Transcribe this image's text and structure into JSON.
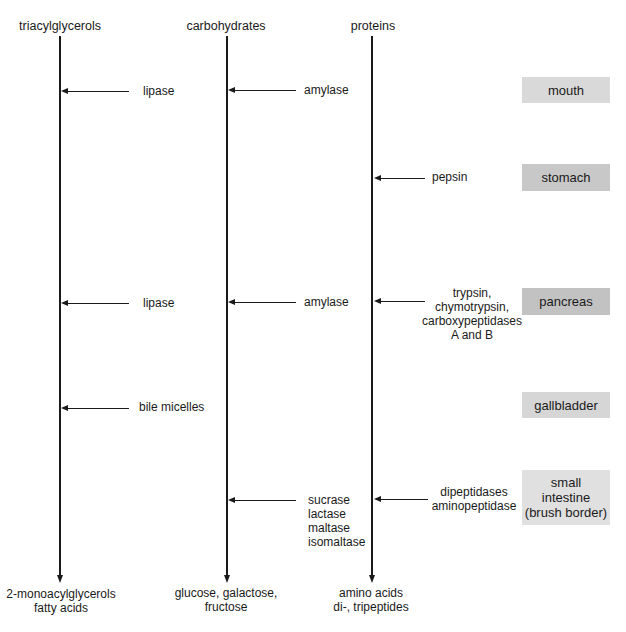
{
  "diagram": {
    "columns": [
      {
        "id": "triacylglycerols",
        "header": "triacylglycerols",
        "products": "2-monoacylglycerols\nfatty acids"
      },
      {
        "id": "carbohydrates",
        "header": "carbohydrates",
        "products": "glucose, galactose,\nfructose"
      },
      {
        "id": "proteins",
        "header": "proteins",
        "products": "amino acids\ndi-, tripeptides"
      }
    ],
    "organs": [
      {
        "id": "mouth",
        "label": "mouth",
        "color": "#d9d9d9"
      },
      {
        "id": "stomach",
        "label": "stomach",
        "color": "#c8c8c8"
      },
      {
        "id": "pancreas",
        "label": "pancreas",
        "color": "#c2c2c2"
      },
      {
        "id": "gallbladder",
        "label": "gallbladder",
        "color": "#d6d6d6"
      },
      {
        "id": "small_intestine",
        "label": "small\nintestine\n(brush border)",
        "color": "#e0e0e0"
      }
    ],
    "enzymes": {
      "mouth_lipid": "lipase",
      "mouth_carb": "amylase",
      "stomach_protein": "pepsin",
      "pancreas_lipid": "lipase",
      "pancreas_carb": "amylase",
      "pancreas_protein": "trypsin,\nchymotrypsin,\ncarboxypeptidases\nA and B",
      "gallbladder_lipid": "bile micelles",
      "intestine_carb": "sucrase\nlactase\nmaltase\nisomaltase",
      "intestine_protein": "dipeptidases\naminopeptidase"
    },
    "colors": {
      "line": "#1a1a1a",
      "background": "#ffffff"
    }
  }
}
